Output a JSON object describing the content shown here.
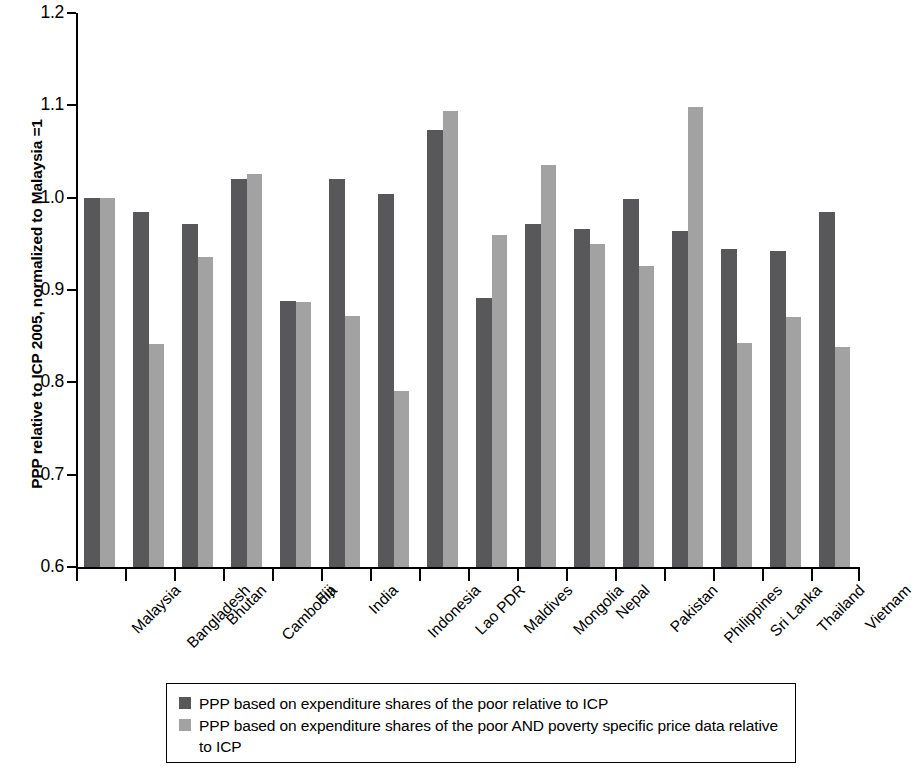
{
  "chart_data": {
    "type": "bar",
    "title": "",
    "subtitle": "",
    "xlabel": "",
    "ylabel": "PPP relative to ICP 2005, normalized to Malaysia =1",
    "ylim": [
      0.6,
      1.2
    ],
    "ytick_labels": [
      "1.2",
      "1.1",
      "1.0",
      "0.9",
      "0.8",
      "0.7",
      "0.6"
    ],
    "ytick_values": [
      1.2,
      1.1,
      1.0,
      0.9,
      0.8,
      0.7,
      0.6
    ],
    "grid": false,
    "legend_position": "below-plot",
    "categories": [
      "Malaysia",
      "Bangladesh",
      "Bhutan",
      "Cambodia",
      "Fiji",
      "India",
      "Indonesia",
      "Lao PDR",
      "Maldives",
      "Mongolia",
      "Nepal",
      "Pakistan",
      "Philippines",
      "Sri Lanka",
      "Thailand",
      "Vietnam"
    ],
    "series": [
      {
        "name": "PPP based on expenditure shares of the poor relative to ICP",
        "color": "#58585a",
        "values": [
          1.0,
          0.985,
          0.971,
          1.02,
          0.888,
          1.02,
          1.004,
          1.073,
          0.891,
          0.972,
          0.966,
          0.999,
          0.964,
          0.944,
          0.942,
          0.985
        ]
      },
      {
        "name": "PPP based on expenditure shares of the poor AND poverty specific price data relative to ICP",
        "color": "#a2a2a2",
        "values": [
          1.0,
          0.841,
          0.936,
          1.026,
          0.887,
          0.872,
          0.791,
          1.094,
          0.96,
          1.035,
          0.95,
          0.926,
          1.098,
          0.843,
          0.871,
          0.838
        ]
      }
    ]
  },
  "legend": {
    "items": [
      {
        "swatch": "dark",
        "label": "PPP based on expenditure shares of the poor relative to ICP"
      },
      {
        "swatch": "light",
        "label": "PPP based on expenditure shares of the poor AND poverty specific price data relative to ICP"
      }
    ]
  }
}
